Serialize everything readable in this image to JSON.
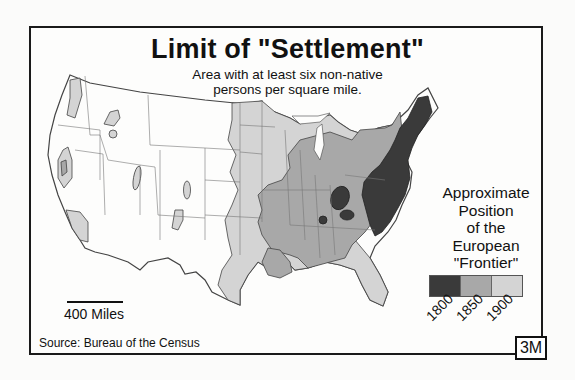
{
  "map": {
    "title": "Limit of \"Settlement\"",
    "subtitle_line1": "Area with at least six non-native",
    "subtitle_line2": "persons per square mile.",
    "region": "Contiguous United States",
    "legend": {
      "title_lines": [
        "Approximate",
        "Position",
        "of the",
        "European",
        "\"Frontier\""
      ],
      "entries": [
        {
          "label": "1800",
          "color": "#3a3a3a"
        },
        {
          "label": "1850",
          "color": "#a8a8a8"
        },
        {
          "label": "1900",
          "color": "#d4d4d4"
        }
      ]
    },
    "scale_bar": {
      "label": "400 Miles"
    },
    "source": "Source: Bureau of the Census",
    "badge": "3M"
  },
  "colors": {
    "frame": "#1a1a1a",
    "unsettled": "#fdfdfc",
    "state_border": "#777777",
    "outline": "#444444"
  }
}
